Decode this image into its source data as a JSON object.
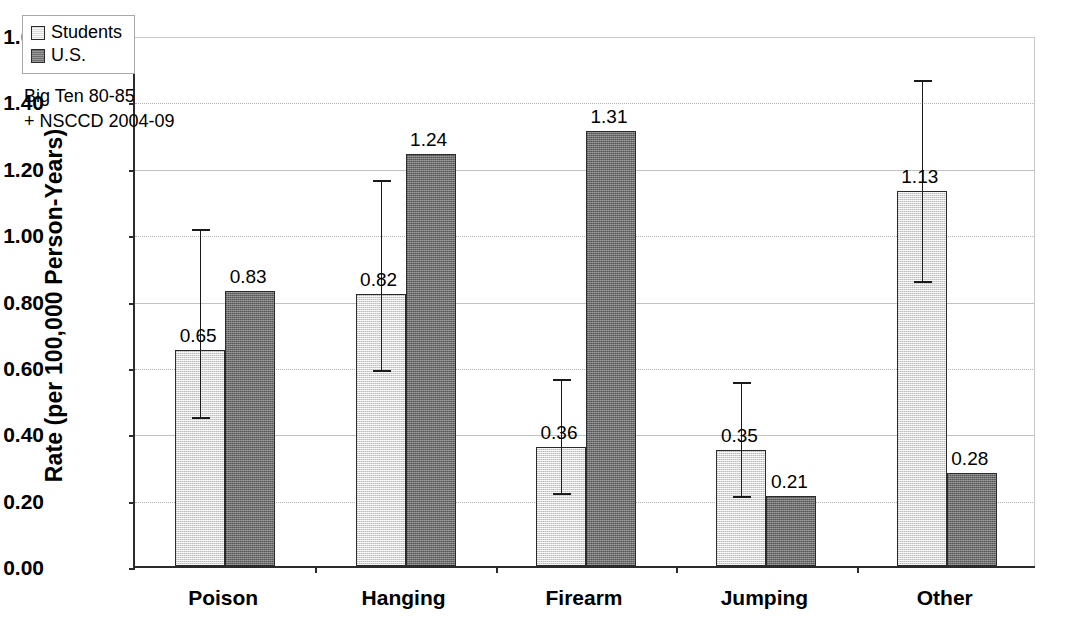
{
  "chart_data": {
    "type": "bar",
    "title": "",
    "xlabel": "",
    "ylabel": "Rate (per 100,000 Person-Years)",
    "ylim": [
      0.0,
      1.6
    ],
    "ytick_step": 0.2,
    "ytick_labels": [
      "1.60",
      "1.40",
      "1.20",
      "1.00",
      "0.80",
      "0.60",
      "0.40",
      "0.20",
      "0.00"
    ],
    "ytick_values": [
      1.6,
      1.4,
      1.2,
      1.0,
      0.8,
      0.6,
      0.4,
      0.2,
      0.0
    ],
    "grid": true,
    "grid_axis": "y",
    "legend_position": "top-left",
    "categories": [
      "Poison",
      "Hanging",
      "Firearm",
      "Jumping",
      "Other"
    ],
    "series": [
      {
        "name": "Students",
        "color": "#d8d8d8",
        "values": [
          0.65,
          0.82,
          0.36,
          0.35,
          1.13
        ],
        "labels": [
          "0.65",
          "0.82",
          "0.36",
          "0.35",
          "1.13"
        ],
        "error_low": [
          0.45,
          0.59,
          0.22,
          0.21,
          0.86
        ],
        "error_high": [
          1.02,
          1.17,
          0.57,
          0.56,
          1.47
        ]
      },
      {
        "name": "U.S.",
        "color": "#6e6e6e",
        "values": [
          0.83,
          1.24,
          1.31,
          0.21,
          0.28
        ],
        "labels": [
          "0.83",
          "1.24",
          "1.31",
          "0.21",
          "0.28"
        ],
        "error_low": [
          null,
          null,
          null,
          null,
          null
        ],
        "error_high": [
          null,
          null,
          null,
          null,
          null
        ]
      }
    ],
    "annotations": [
      "Big Ten 80-85",
      "+ NSCCD 2004-09"
    ]
  },
  "legend": {
    "items": [
      {
        "label": "Students",
        "swatch": "light-gray-square"
      },
      {
        "label": "U.S.",
        "swatch": "dark-gray-square"
      }
    ]
  },
  "annotation": {
    "line1": "Big Ten 80-85",
    "line2": "+ NSCCD 2004-09"
  },
  "axes": {
    "y_title": "Rate (per 100,000 Person-Years)"
  },
  "colors": {
    "students": "#d8d8d8",
    "us": "#6e6e6e",
    "axis": "#2b2b2b",
    "grid": "#b4b4b4"
  }
}
